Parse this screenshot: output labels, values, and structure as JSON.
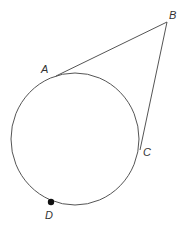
{
  "diagram": {
    "type": "geometry",
    "colors": {
      "line": "#555555",
      "text": "#333333",
      "point": "#111111",
      "background": "#ffffff"
    },
    "circle": {
      "cx": 75,
      "cy": 139,
      "rx": 64,
      "ry": 66
    },
    "points": {
      "A": {
        "label": "A",
        "x": 56,
        "y": 76,
        "label_x": 41,
        "label_y": 73
      },
      "B": {
        "label": "B",
        "x": 167,
        "y": 22,
        "label_x": 169,
        "label_y": 19
      },
      "C": {
        "label": "C",
        "x": 140,
        "y": 150,
        "label_x": 143,
        "label_y": 156
      },
      "D": {
        "label": "D",
        "x": 51,
        "y": 202,
        "label_x": 45,
        "label_y": 219
      }
    },
    "segments": [
      {
        "name": "AB",
        "from": "A",
        "to": "B"
      },
      {
        "name": "BC",
        "from": "B",
        "to": "C"
      }
    ]
  }
}
